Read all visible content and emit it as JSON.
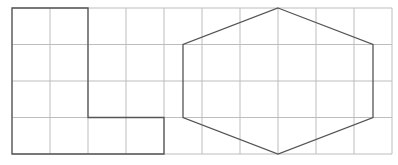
{
  "diagram": {
    "type": "grid-shapes",
    "grid": {
      "columns": 10,
      "rows": 4,
      "origin_px": [
        12,
        8
      ],
      "cell_width_px": 38,
      "cell_height_px": 36.5,
      "line_color": "#bdbdbd"
    },
    "shapes": [
      {
        "name": "l-shape",
        "kind": "polygon",
        "stroke": "#555555",
        "points_grid": [
          [
            0,
            0
          ],
          [
            2,
            0
          ],
          [
            2,
            3
          ],
          [
            4,
            3
          ],
          [
            4,
            4
          ],
          [
            0,
            4
          ]
        ]
      },
      {
        "name": "hexagon",
        "kind": "polygon",
        "stroke": "#555555",
        "points_grid": [
          [
            7,
            0
          ],
          [
            9.5,
            1
          ],
          [
            9.5,
            3
          ],
          [
            7,
            4
          ],
          [
            4.5,
            3
          ],
          [
            4.5,
            1
          ]
        ]
      }
    ]
  }
}
